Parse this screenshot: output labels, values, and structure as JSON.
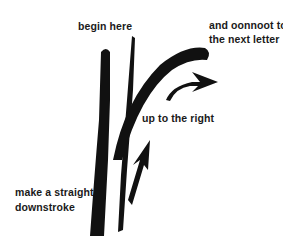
{
  "diagram": {
    "labels": {
      "begin": "begin here",
      "connect_line1": "and oonnoot to",
      "connect_line2": "the next letter",
      "up": "up to the right",
      "down_line1": "make a straight",
      "down_line2": "downstroke"
    },
    "icons": [
      "downstroke-brush",
      "upstroke-thin-line",
      "curve-stroke",
      "arrow-up-right",
      "arrow-right-curved"
    ],
    "colors": {
      "ink": "#111111",
      "background": "#ffffff"
    }
  }
}
